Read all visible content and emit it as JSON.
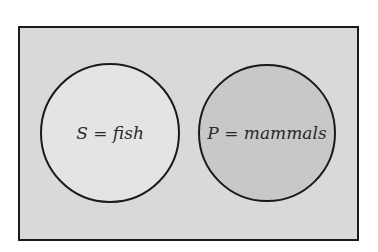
{
  "diagram": {
    "type": "venn",
    "universe": {
      "fill": "#d9d9d9",
      "stroke": "#1a1a1a"
    },
    "sets": [
      {
        "id": "S",
        "label": "S = fish",
        "symbol": "S",
        "description": "fish",
        "fill": "#e4e4e4",
        "stroke": "#1a1a1a"
      },
      {
        "id": "P",
        "label": "P = mammals",
        "symbol": "P",
        "description": "mammals",
        "fill": "#c8c8c8",
        "stroke": "#1a1a1a"
      }
    ],
    "relationship": "disjoint (no overlap)"
  }
}
